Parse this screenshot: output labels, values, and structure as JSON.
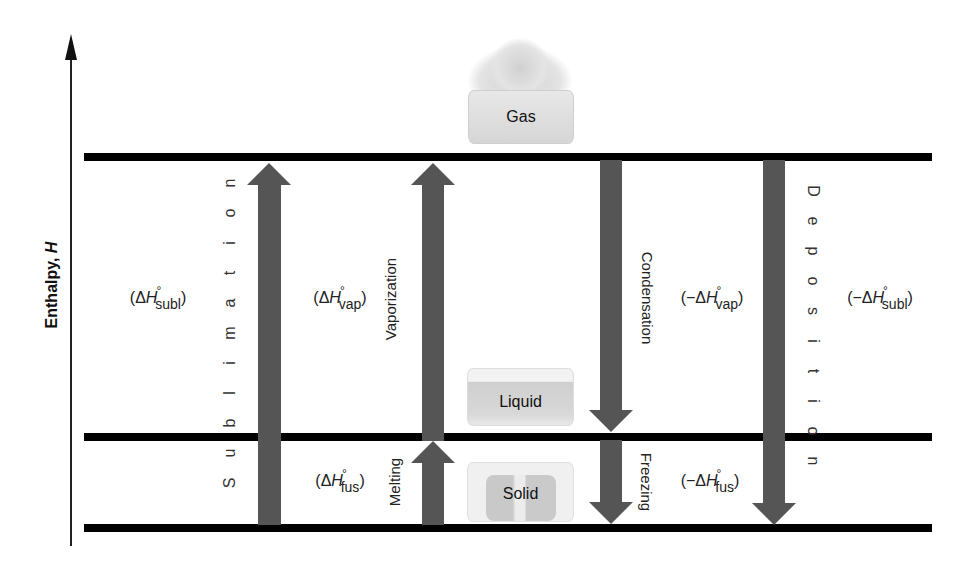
{
  "diagram": {
    "type": "enthalpy-level-diagram",
    "axis": {
      "label_text": "Enthalpy, ",
      "label_var": "H",
      "direction": "up"
    },
    "levels": [
      {
        "id": "gas",
        "label": "Gas",
        "y": 157
      },
      {
        "id": "liquid",
        "label": "Liquid",
        "y": 437
      },
      {
        "id": "solid",
        "label": "Solid",
        "y": 528
      }
    ],
    "processes": [
      {
        "id": "sublimation",
        "label": "Sublimation",
        "letters": [
          "S",
          "u",
          "b",
          "l",
          "i",
          "m",
          "a",
          "t",
          "i",
          "o",
          "n"
        ],
        "direction": "up",
        "from": "solid",
        "to": "gas",
        "enthalpy": {
          "prefix": "(",
          "sign": "",
          "delta": "Δ",
          "var": "H",
          "degree": "°",
          "sub": "subl",
          "suffix": ")"
        }
      },
      {
        "id": "vaporization",
        "label": "Vaporization",
        "direction": "up",
        "from": "liquid",
        "to": "gas",
        "enthalpy": {
          "prefix": "(",
          "sign": "",
          "delta": "Δ",
          "var": "H",
          "degree": "°",
          "sub": "vap",
          "suffix": ")"
        }
      },
      {
        "id": "melting",
        "label": "Melting",
        "direction": "up",
        "from": "solid",
        "to": "liquid",
        "enthalpy": {
          "prefix": "(",
          "sign": "",
          "delta": "Δ",
          "var": "H",
          "degree": "°",
          "sub": "fus",
          "suffix": ")"
        }
      },
      {
        "id": "condensation",
        "label": "Condensation",
        "direction": "down",
        "from": "gas",
        "to": "liquid",
        "enthalpy": {
          "prefix": "(",
          "sign": "−",
          "delta": "Δ",
          "var": "H",
          "degree": "°",
          "sub": "vap",
          "suffix": ")"
        }
      },
      {
        "id": "freezing",
        "label": "Freezing",
        "direction": "down",
        "from": "liquid",
        "to": "solid",
        "enthalpy": {
          "prefix": "(",
          "sign": "−",
          "delta": "Δ",
          "var": "H",
          "degree": "°",
          "sub": "fus",
          "suffix": ")"
        }
      },
      {
        "id": "deposition",
        "label": "Deposition",
        "letters": [
          "D",
          "e",
          "p",
          "o",
          "s",
          "i",
          "t",
          "i",
          "o",
          "n"
        ],
        "direction": "down",
        "from": "gas",
        "to": "solid",
        "enthalpy": {
          "prefix": "(",
          "sign": "−",
          "delta": "Δ",
          "var": "H",
          "degree": "°",
          "sub": "subl",
          "suffix": ")"
        }
      }
    ],
    "colors": {
      "level_line": "#000000",
      "arrow": "#555555",
      "text": "#222222",
      "container": "#d8d8d8"
    }
  }
}
